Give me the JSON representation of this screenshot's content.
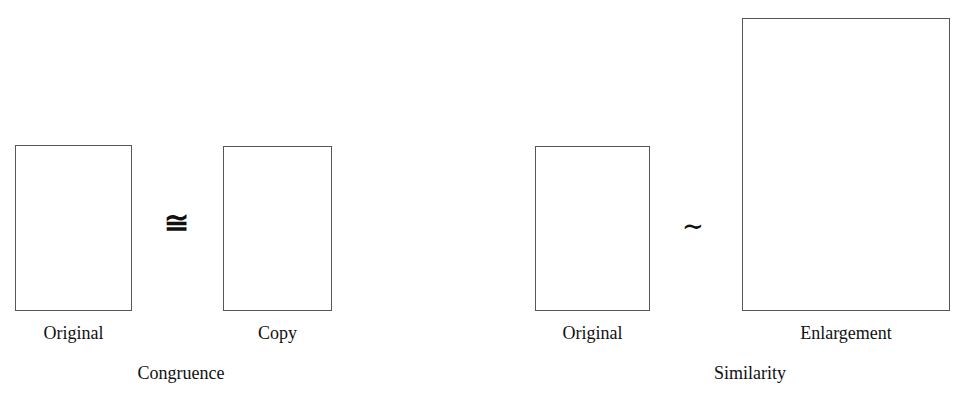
{
  "figure": {
    "background_color": "#ffffff",
    "stroke_color": "#565656",
    "text_color": "#111111"
  },
  "groups": [
    {
      "caption": "Congruence",
      "relation_symbol": "≅",
      "relation_symbol_name": "congruent-to",
      "shapes": [
        {
          "label": "Original",
          "kind": "rectangle"
        },
        {
          "label": "Copy",
          "kind": "rectangle"
        }
      ]
    },
    {
      "caption": "Similarity",
      "relation_symbol": "∼",
      "relation_symbol_name": "similar-to",
      "shapes": [
        {
          "label": "Original",
          "kind": "rectangle"
        },
        {
          "label": "Enlargement",
          "kind": "rectangle"
        }
      ]
    }
  ]
}
